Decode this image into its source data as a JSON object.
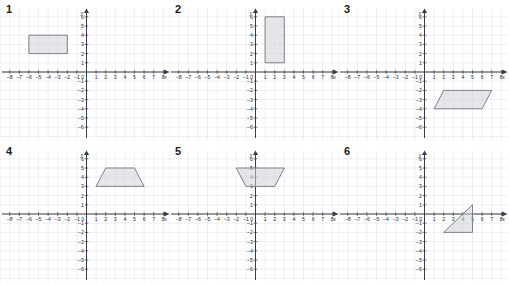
{
  "page": {
    "background_color": "#ffffff",
    "grid_color": "#dadee6",
    "axis_color": "#3b3b4a",
    "shape_fill": "#cfd2d6",
    "shape_stroke": "#7f8289",
    "columns": 3,
    "rows": 2
  },
  "axes": {
    "x_label": "x",
    "y_label": "y",
    "x_min": -8,
    "x_max": 8,
    "y_min": -6,
    "y_max": 6,
    "x_tick_labels": [
      "-8",
      "-7",
      "-6",
      "-5",
      "-4",
      "-3",
      "-2",
      "-1",
      "0",
      "1",
      "2",
      "3",
      "4",
      "5",
      "6",
      "7",
      "8"
    ],
    "y_tick_labels": [
      "6",
      "5",
      "4",
      "3",
      "2",
      "1",
      "-1",
      "-2",
      "-3",
      "-4",
      "-5",
      "-6"
    ],
    "origin_label": "0"
  },
  "chart_data": [
    {
      "type": "scatter",
      "id": "graph-1",
      "label": "1",
      "title": "",
      "xlabel": "x",
      "ylabel": "y",
      "xlim": [
        -8,
        8
      ],
      "ylim": [
        -6,
        6
      ],
      "grid": true,
      "shape": "rectangle",
      "vertices": [
        [
          -6,
          4
        ],
        [
          -2,
          4
        ],
        [
          -2,
          2
        ],
        [
          -6,
          2
        ]
      ]
    },
    {
      "type": "scatter",
      "id": "graph-2",
      "label": "2",
      "title": "",
      "xlabel": "x",
      "ylabel": "y",
      "xlim": [
        -8,
        8
      ],
      "ylim": [
        -6,
        6
      ],
      "grid": true,
      "shape": "rectangle",
      "vertices": [
        [
          1,
          6
        ],
        [
          3,
          6
        ],
        [
          3,
          1
        ],
        [
          1,
          1
        ]
      ]
    },
    {
      "type": "scatter",
      "id": "graph-3",
      "label": "3",
      "title": "",
      "xlabel": "x",
      "ylabel": "y",
      "xlim": [
        -8,
        8
      ],
      "ylim": [
        -6,
        6
      ],
      "grid": true,
      "shape": "parallelogram",
      "vertices": [
        [
          2,
          -2
        ],
        [
          7,
          -2
        ],
        [
          6,
          -4
        ],
        [
          1,
          -4
        ]
      ]
    },
    {
      "type": "scatter",
      "id": "graph-4",
      "label": "4",
      "title": "",
      "xlabel": "x",
      "ylabel": "y",
      "xlim": [
        -8,
        8
      ],
      "ylim": [
        -6,
        6
      ],
      "grid": true,
      "shape": "trapezoid",
      "vertices": [
        [
          2,
          5
        ],
        [
          5,
          5
        ],
        [
          6,
          3
        ],
        [
          1,
          3
        ]
      ]
    },
    {
      "type": "scatter",
      "id": "graph-5",
      "label": "5",
      "title": "",
      "xlabel": "x",
      "ylabel": "y",
      "xlim": [
        -8,
        8
      ],
      "ylim": [
        -6,
        6
      ],
      "grid": true,
      "shape": "trapezoid",
      "vertices": [
        [
          -2,
          5
        ],
        [
          3,
          5
        ],
        [
          2,
          3
        ],
        [
          -1,
          3
        ]
      ]
    },
    {
      "type": "scatter",
      "id": "graph-6",
      "label": "6",
      "title": "",
      "xlabel": "x",
      "ylabel": "y",
      "xlim": [
        -8,
        8
      ],
      "ylim": [
        -6,
        6
      ],
      "grid": true,
      "shape": "right-triangle",
      "vertices": [
        [
          5,
          1
        ],
        [
          5,
          -2
        ],
        [
          2,
          -2
        ]
      ]
    }
  ]
}
